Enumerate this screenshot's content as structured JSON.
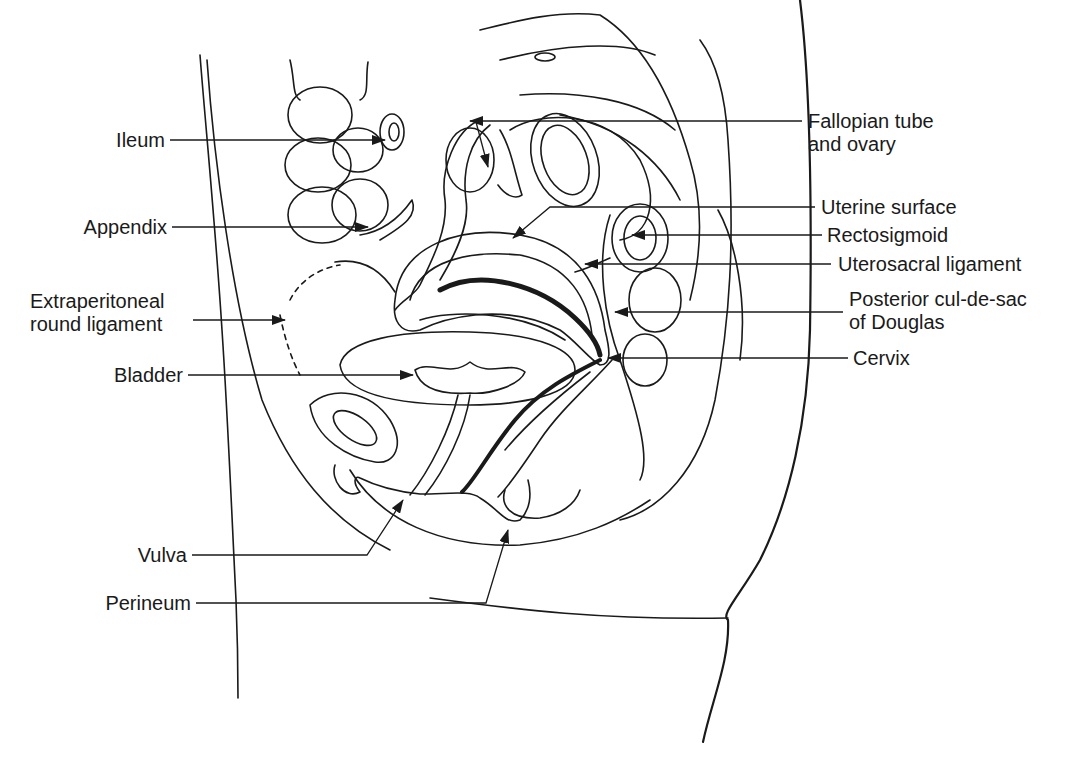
{
  "figure": {
    "type": "anatomical sagittal section",
    "line_color": "#1a1a1a",
    "background": "#ffffff"
  },
  "labels_left": [
    {
      "id": "ileum",
      "text": "Ileum"
    },
    {
      "id": "appendix",
      "text": "Appendix"
    },
    {
      "id": "round_ligament",
      "line1": "Extraperitoneal",
      "line2": "round ligament"
    },
    {
      "id": "bladder",
      "text": "Bladder"
    },
    {
      "id": "vulva",
      "text": "Vulva"
    },
    {
      "id": "perineum",
      "text": "Perineum"
    }
  ],
  "labels_right": [
    {
      "id": "fallopian",
      "line1": "Fallopian tube",
      "line2": "and ovary"
    },
    {
      "id": "uterine_surface",
      "text": "Uterine surface"
    },
    {
      "id": "rectosigmoid",
      "text": "Rectosigmoid"
    },
    {
      "id": "uterosacral",
      "text": "Uterosacral ligament"
    },
    {
      "id": "cul_de_sac",
      "line1": "Posterior cul-de-sac",
      "line2": "of Douglas"
    },
    {
      "id": "cervix",
      "text": "Cervix"
    }
  ]
}
